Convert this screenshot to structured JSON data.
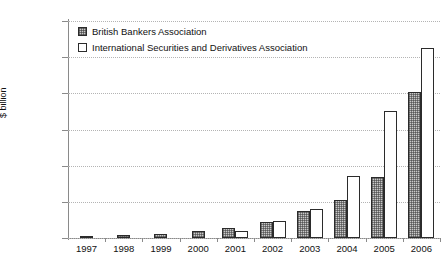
{
  "chart_data": {
    "type": "bar",
    "title": "",
    "subtitle": "",
    "xlabel": "",
    "ylabel": "$ billion",
    "categories": [
      "1997",
      "1998",
      "1999",
      "2000",
      "2001",
      "2002",
      "2003",
      "2004",
      "2005",
      "2006"
    ],
    "series": [
      {
        "name": "British Bankers Association",
        "values": [
          180,
          350,
          590,
          1000,
          1400,
          2150,
          3800,
          5250,
          8400,
          20200
        ]
      },
      {
        "name": "International Securities and Derivatives Association",
        "values": [
          null,
          null,
          null,
          null,
          920,
          2400,
          3950,
          8600,
          17500,
          26300
        ]
      }
    ],
    "ylim": [
      0,
      30000
    ],
    "yticks": [
      0,
      5000,
      10000,
      15000,
      20000,
      25000,
      30000
    ],
    "ytick_labels": [
      "-",
      "5,000",
      "10,000",
      "15,000",
      "20,000",
      "25,000",
      "30,000"
    ],
    "grid": "horizontal-dotted",
    "legend_position": "top-left",
    "legend": [
      "British Bankers Association",
      "International Securities and Derivatives Association"
    ]
  }
}
